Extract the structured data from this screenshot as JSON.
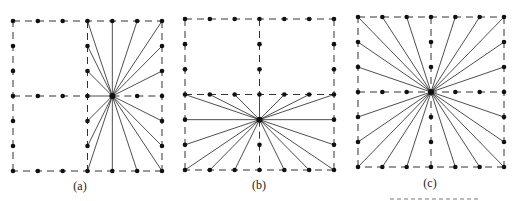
{
  "figure": {
    "panels": [
      {
        "id": "a",
        "label": "(a)",
        "grid": {
          "cols": 6,
          "rows": 6
        },
        "dashed_lines": [
          {
            "from": [
              0,
              0
            ],
            "to": [
              6,
              0
            ]
          },
          {
            "from": [
              6,
              0
            ],
            "to": [
              6,
              6
            ]
          },
          {
            "from": [
              6,
              6
            ],
            "to": [
              0,
              6
            ]
          },
          {
            "from": [
              0,
              6
            ],
            "to": [
              0,
              0
            ]
          },
          {
            "from": [
              3,
              0
            ],
            "to": [
              3,
              6
            ]
          },
          {
            "from": [
              0,
              3
            ],
            "to": [
              3,
              3
            ]
          },
          {
            "from": [
              4,
              3
            ],
            "to": [
              6,
              3
            ]
          }
        ],
        "dots": [
          [
            0,
            0
          ],
          [
            1,
            0
          ],
          [
            2,
            0
          ],
          [
            3,
            0
          ],
          [
            4,
            0
          ],
          [
            5,
            0
          ],
          [
            6,
            0
          ],
          [
            0,
            1
          ],
          [
            0,
            2
          ],
          [
            0,
            3
          ],
          [
            0,
            4
          ],
          [
            0,
            5
          ],
          [
            0,
            6
          ],
          [
            1,
            6
          ],
          [
            2,
            6
          ],
          [
            3,
            6
          ],
          [
            4,
            6
          ],
          [
            5,
            6
          ],
          [
            6,
            6
          ],
          [
            1,
            3
          ],
          [
            2,
            3
          ],
          [
            3,
            3
          ],
          [
            3,
            1
          ],
          [
            3,
            2
          ],
          [
            3,
            4
          ],
          [
            3,
            5
          ],
          [
            6,
            1
          ],
          [
            6,
            2
          ],
          [
            6,
            3
          ],
          [
            6,
            4
          ],
          [
            6,
            5
          ],
          [
            5,
            3
          ],
          [
            4,
            3
          ]
        ],
        "center": [
          4,
          3
        ],
        "rays_to": [
          [
            3,
            0
          ],
          [
            4,
            0
          ],
          [
            5,
            0
          ],
          [
            6,
            0
          ],
          [
            3,
            1
          ],
          [
            3,
            2
          ],
          [
            3,
            3
          ],
          [
            3,
            4
          ],
          [
            3,
            5
          ],
          [
            3,
            6
          ],
          [
            4,
            6
          ],
          [
            5,
            6
          ],
          [
            6,
            6
          ],
          [
            6,
            1
          ],
          [
            6,
            2
          ],
          [
            6,
            4
          ],
          [
            6,
            5
          ]
        ]
      },
      {
        "id": "b",
        "label": "(b)",
        "grid": {
          "cols": 6,
          "rows": 6
        },
        "dashed_lines": [
          {
            "from": [
              0,
              0
            ],
            "to": [
              6,
              0
            ]
          },
          {
            "from": [
              6,
              0
            ],
            "to": [
              6,
              6
            ]
          },
          {
            "from": [
              6,
              6
            ],
            "to": [
              0,
              6
            ]
          },
          {
            "from": [
              0,
              6
            ],
            "to": [
              0,
              0
            ]
          },
          {
            "from": [
              3,
              0
            ],
            "to": [
              3,
              3
            ]
          },
          {
            "from": [
              0,
              3
            ],
            "to": [
              6,
              3
            ]
          },
          {
            "from": [
              3,
              4
            ],
            "to": [
              3,
              6
            ]
          }
        ],
        "dots": [
          [
            0,
            0
          ],
          [
            1,
            0
          ],
          [
            2,
            0
          ],
          [
            3,
            0
          ],
          [
            4,
            0
          ],
          [
            5,
            0
          ],
          [
            6,
            0
          ],
          [
            0,
            1
          ],
          [
            0,
            2
          ],
          [
            0,
            3
          ],
          [
            0,
            4
          ],
          [
            0,
            5
          ],
          [
            0,
            6
          ],
          [
            1,
            6
          ],
          [
            2,
            6
          ],
          [
            3,
            6
          ],
          [
            4,
            6
          ],
          [
            5,
            6
          ],
          [
            6,
            6
          ],
          [
            6,
            1
          ],
          [
            6,
            2
          ],
          [
            6,
            3
          ],
          [
            6,
            4
          ],
          [
            6,
            5
          ],
          [
            3,
            1
          ],
          [
            3,
            2
          ],
          [
            1,
            3
          ],
          [
            2,
            3
          ],
          [
            3,
            3
          ],
          [
            4,
            3
          ],
          [
            5,
            3
          ],
          [
            3,
            4
          ],
          [
            3,
            5
          ]
        ],
        "center": [
          3,
          4
        ],
        "rays_to": [
          [
            0,
            3
          ],
          [
            1,
            3
          ],
          [
            2,
            3
          ],
          [
            3,
            3
          ],
          [
            4,
            3
          ],
          [
            5,
            3
          ],
          [
            6,
            3
          ],
          [
            0,
            4
          ],
          [
            0,
            5
          ],
          [
            6,
            4
          ],
          [
            6,
            5
          ],
          [
            0,
            6
          ],
          [
            1,
            6
          ],
          [
            2,
            6
          ],
          [
            4,
            6
          ],
          [
            5,
            6
          ],
          [
            6,
            6
          ]
        ]
      },
      {
        "id": "c",
        "label": "(c)",
        "grid": {
          "cols": 6,
          "rows": 6
        },
        "dashed_lines": [
          {
            "from": [
              0,
              0
            ],
            "to": [
              6,
              0
            ]
          },
          {
            "from": [
              6,
              0
            ],
            "to": [
              6,
              6
            ]
          },
          {
            "from": [
              6,
              6
            ],
            "to": [
              0,
              6
            ]
          },
          {
            "from": [
              0,
              6
            ],
            "to": [
              0,
              0
            ]
          },
          {
            "from": [
              3,
              0
            ],
            "to": [
              3,
              6
            ]
          },
          {
            "from": [
              0,
              3
            ],
            "to": [
              6,
              3
            ]
          }
        ],
        "dots": [
          [
            0,
            0
          ],
          [
            1,
            0
          ],
          [
            2,
            0
          ],
          [
            3,
            0
          ],
          [
            4,
            0
          ],
          [
            5,
            0
          ],
          [
            6,
            0
          ],
          [
            0,
            1
          ],
          [
            0,
            2
          ],
          [
            0,
            3
          ],
          [
            0,
            4
          ],
          [
            0,
            5
          ],
          [
            0,
            6
          ],
          [
            1,
            6
          ],
          [
            2,
            6
          ],
          [
            3,
            6
          ],
          [
            4,
            6
          ],
          [
            5,
            6
          ],
          [
            6,
            6
          ],
          [
            6,
            1
          ],
          [
            6,
            2
          ],
          [
            6,
            3
          ],
          [
            6,
            4
          ],
          [
            6,
            5
          ],
          [
            3,
            1
          ],
          [
            3,
            2
          ],
          [
            3,
            3
          ],
          [
            3,
            4
          ],
          [
            3,
            5
          ],
          [
            1,
            3
          ],
          [
            2,
            3
          ],
          [
            4,
            3
          ],
          [
            5,
            3
          ]
        ],
        "center": [
          3,
          3
        ],
        "rays_to": [
          [
            0,
            0
          ],
          [
            1,
            0
          ],
          [
            2,
            0
          ],
          [
            4,
            0
          ],
          [
            5,
            0
          ],
          [
            6,
            0
          ],
          [
            0,
            1
          ],
          [
            0,
            2
          ],
          [
            0,
            4
          ],
          [
            0,
            5
          ],
          [
            6,
            1
          ],
          [
            6,
            2
          ],
          [
            6,
            4
          ],
          [
            6,
            5
          ],
          [
            0,
            6
          ],
          [
            1,
            6
          ],
          [
            2,
            6
          ],
          [
            4,
            6
          ],
          [
            5,
            6
          ],
          [
            6,
            6
          ]
        ]
      }
    ]
  }
}
